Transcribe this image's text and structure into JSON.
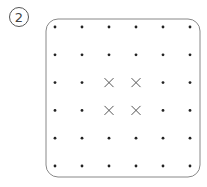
{
  "problem": {
    "number_label": "2",
    "grid": {
      "rows": 6,
      "cols": 6,
      "origin_x": 55,
      "origin_y": 27,
      "step_x": 27,
      "step_y": 27.8,
      "frame": {
        "x": 46,
        "y": 19,
        "width": 154,
        "height": 158,
        "radius": 12,
        "stroke": "#888888"
      },
      "dot_color": "#222222",
      "mark_color": "#555555",
      "marks": [
        {
          "row": 2,
          "col": 2,
          "type": "x"
        },
        {
          "row": 2,
          "col": 3,
          "type": "x"
        },
        {
          "row": 3,
          "col": 2,
          "type": "x"
        },
        {
          "row": 3,
          "col": 3,
          "type": "x"
        }
      ]
    }
  }
}
